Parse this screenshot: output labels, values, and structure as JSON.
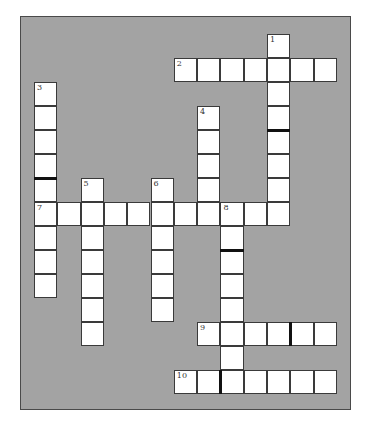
{
  "puzzle": {
    "type": "crossword",
    "colors": {
      "background": "#a3a3a3",
      "cell": "#ffffff",
      "border": "#3a3a3a",
      "bar": "#111111"
    },
    "grid": {
      "origin_x": 34,
      "origin_y": 34,
      "cell_w": 23.3,
      "cell_h": 24
    },
    "entries": [
      {
        "number": "1",
        "direction": "down",
        "row": 0,
        "col": 10,
        "length": 8
      },
      {
        "number": "2",
        "direction": "across",
        "row": 1,
        "col": 6,
        "length": 7
      },
      {
        "number": "3",
        "direction": "down",
        "row": 2,
        "col": 0,
        "length": 9
      },
      {
        "number": "4",
        "direction": "down",
        "row": 3,
        "col": 7,
        "length": 5
      },
      {
        "number": "5",
        "direction": "down",
        "row": 6,
        "col": 2,
        "length": 7
      },
      {
        "number": "6",
        "direction": "down",
        "row": 6,
        "col": 5,
        "length": 6
      },
      {
        "number": "7",
        "direction": "across",
        "row": 7,
        "col": 0,
        "length": 11
      },
      {
        "number": "8",
        "direction": "down",
        "row": 7,
        "col": 8,
        "length": 8
      },
      {
        "number": "9",
        "direction": "across",
        "row": 12,
        "col": 7,
        "length": 6
      },
      {
        "number": "10",
        "direction": "across",
        "row": 14,
        "col": 6,
        "length": 7
      }
    ],
    "bars": [
      {
        "type": "h",
        "row": 5,
        "col": 0,
        "note": "between rows 5 and 6 in col 0"
      },
      {
        "type": "h",
        "row": 3,
        "col": 10,
        "note": "between rows 3 and 4 in col 10"
      },
      {
        "type": "h",
        "row": 8,
        "col": 8,
        "note": "between rows 8 and 9 in col 8"
      },
      {
        "type": "v",
        "row": 12,
        "col": 10,
        "note": "between cols 10 and 11 in row 12"
      },
      {
        "type": "v",
        "row": 14,
        "col": 7,
        "note": "between cols 7 and 8 in row 14"
      }
    ]
  }
}
